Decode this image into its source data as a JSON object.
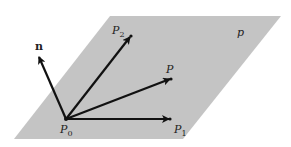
{
  "diagram": {
    "colors": {
      "plane": "#c4c4c4",
      "vector": "#111111",
      "text": "#222222"
    },
    "plane": {
      "label": "p",
      "corners": [
        [
          110,
          16
        ],
        [
          281,
          16
        ],
        [
          183,
          139
        ],
        [
          14,
          139
        ]
      ]
    },
    "origin": {
      "label": "P",
      "sub": "0",
      "x": 66,
      "y": 119
    },
    "vectors": [
      {
        "id": "n",
        "label": "n",
        "to": [
          38,
          55
        ],
        "label_pos": [
          36,
          48
        ],
        "bold": true,
        "dot": false
      },
      {
        "id": "P2",
        "label": "P",
        "sub": "2",
        "to": [
          131,
          36
        ],
        "label_pos": [
          112,
          34
        ],
        "dot": true
      },
      {
        "id": "P",
        "label": "P",
        "sub": "",
        "to": [
          171,
          79
        ],
        "label_pos": [
          166,
          72
        ],
        "dot": true
      },
      {
        "id": "P1",
        "label": "P",
        "sub": "1",
        "to": [
          170,
          119
        ],
        "label_pos": [
          174,
          133
        ],
        "dot": true
      }
    ]
  }
}
